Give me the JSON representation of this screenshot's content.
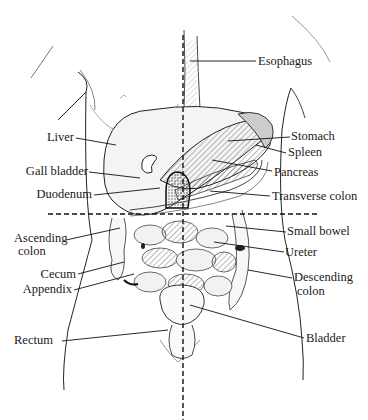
{
  "diagram": {
    "colors": {
      "ink": "#1a1a1a",
      "background": "#ffffff",
      "shade": "#bdbdbd"
    },
    "quadrant_lines": {
      "vertical_x": 183,
      "horizontal_y": 214,
      "style": "dashed"
    },
    "labels_left": [
      {
        "id": "liver",
        "text": "Liver"
      },
      {
        "id": "gall-bladder",
        "text": "Gall bladder"
      },
      {
        "id": "duodenum",
        "text": "Duodenum"
      },
      {
        "id": "ascending-colon-1",
        "text": "Ascending"
      },
      {
        "id": "ascending-colon-2",
        "text": "colon"
      },
      {
        "id": "cecum",
        "text": "Cecum"
      },
      {
        "id": "appendix",
        "text": "Appendix"
      },
      {
        "id": "rectum",
        "text": "Rectum"
      }
    ],
    "labels_right": [
      {
        "id": "esophagus",
        "text": "Esophagus"
      },
      {
        "id": "stomach",
        "text": "Stomach"
      },
      {
        "id": "spleen",
        "text": "Spleen"
      },
      {
        "id": "pancreas",
        "text": "Pancreas"
      },
      {
        "id": "transverse-colon",
        "text": "Transverse colon"
      },
      {
        "id": "small-bowel",
        "text": "Small bowel"
      },
      {
        "id": "ureter",
        "text": "Ureter"
      },
      {
        "id": "descending-colon-1",
        "text": "Descending"
      },
      {
        "id": "descending-colon-2",
        "text": "colon"
      },
      {
        "id": "bladder",
        "text": "Bladder"
      }
    ]
  }
}
